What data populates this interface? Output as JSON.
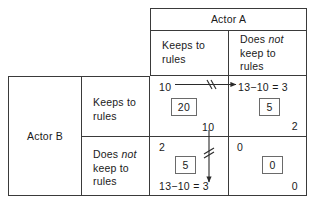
{
  "diagram": {
    "type": "payoff-matrix",
    "column_player": "Actor A",
    "row_player": "Actor B",
    "column_strategies": [
      {
        "line1": "Keeps to",
        "line2": "rules"
      },
      {
        "line1_pre": "Does ",
        "line1_ital": "not",
        "line2": "keep to",
        "line3": "rules"
      }
    ],
    "row_strategies": [
      {
        "line1": "Keeps to",
        "line2": "rules"
      },
      {
        "line1_pre": "Does ",
        "line1_ital": "not",
        "line2": "keep to",
        "line3": "rules"
      }
    ],
    "cells": {
      "keeps_keeps": {
        "row_payoff": "10",
        "boxed": "20",
        "col_payoff": ""
      },
      "keeps_notkeeps": {
        "row_payoff": "13−10 = 3",
        "boxed": "5",
        "col_payoff": "2"
      },
      "notkeeps_keeps": {
        "row_payoff": "2",
        "boxed": "5",
        "col_payoff": "13−10 = 3"
      },
      "notkeeps_notkeeps": {
        "row_payoff": "0",
        "boxed": "0",
        "col_payoff": "0"
      }
    },
    "arrows": {
      "horizontal": {
        "label": "",
        "blocked": true
      },
      "vertical": {
        "label": "10",
        "blocked": true
      }
    },
    "colors": {
      "line": "#3a3a3a",
      "box_outline": "#6a6a6a",
      "text": "#1a1a1a",
      "background": "#ffffff"
    }
  }
}
